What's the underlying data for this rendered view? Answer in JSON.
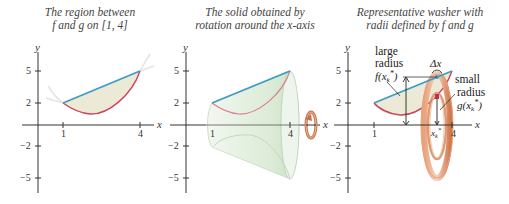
{
  "panels": [
    {
      "caption_line1": "The region between",
      "caption_line2": "f and g on [1, 4]"
    },
    {
      "caption_line1": "The solid obtained by",
      "caption_line2": "rotation around the x-axis"
    },
    {
      "caption_line1": "Representative washer with",
      "caption_line2": "radii defined by f and g"
    }
  ],
  "axes": {
    "x_label": "x",
    "y_label": "y",
    "x_ticks": [
      "1",
      "4"
    ],
    "y_ticks": [
      "5",
      "2",
      "−2",
      "−5"
    ]
  },
  "annotations": {
    "large_line1": "large",
    "large_line2": "radius",
    "large_line3": "f(x",
    "large_sub": "k",
    "large_sup": "*",
    "large_close": ")",
    "small_line1": "small",
    "small_line2": "radius",
    "small_line3": "g(x",
    "small_sub": "k",
    "small_sup": "*",
    "small_close": ")",
    "delta_x": "Δx",
    "xk_label": "x",
    "xk_sub": "k",
    "xk_sup": "*"
  },
  "colors": {
    "f_curve": "#3a9cc8",
    "g_curve": "#d0445a",
    "region_fill": "#ece9d6",
    "solid_fill": "#e3efe0",
    "washer": "#d8885a",
    "axis": "#333333"
  }
}
